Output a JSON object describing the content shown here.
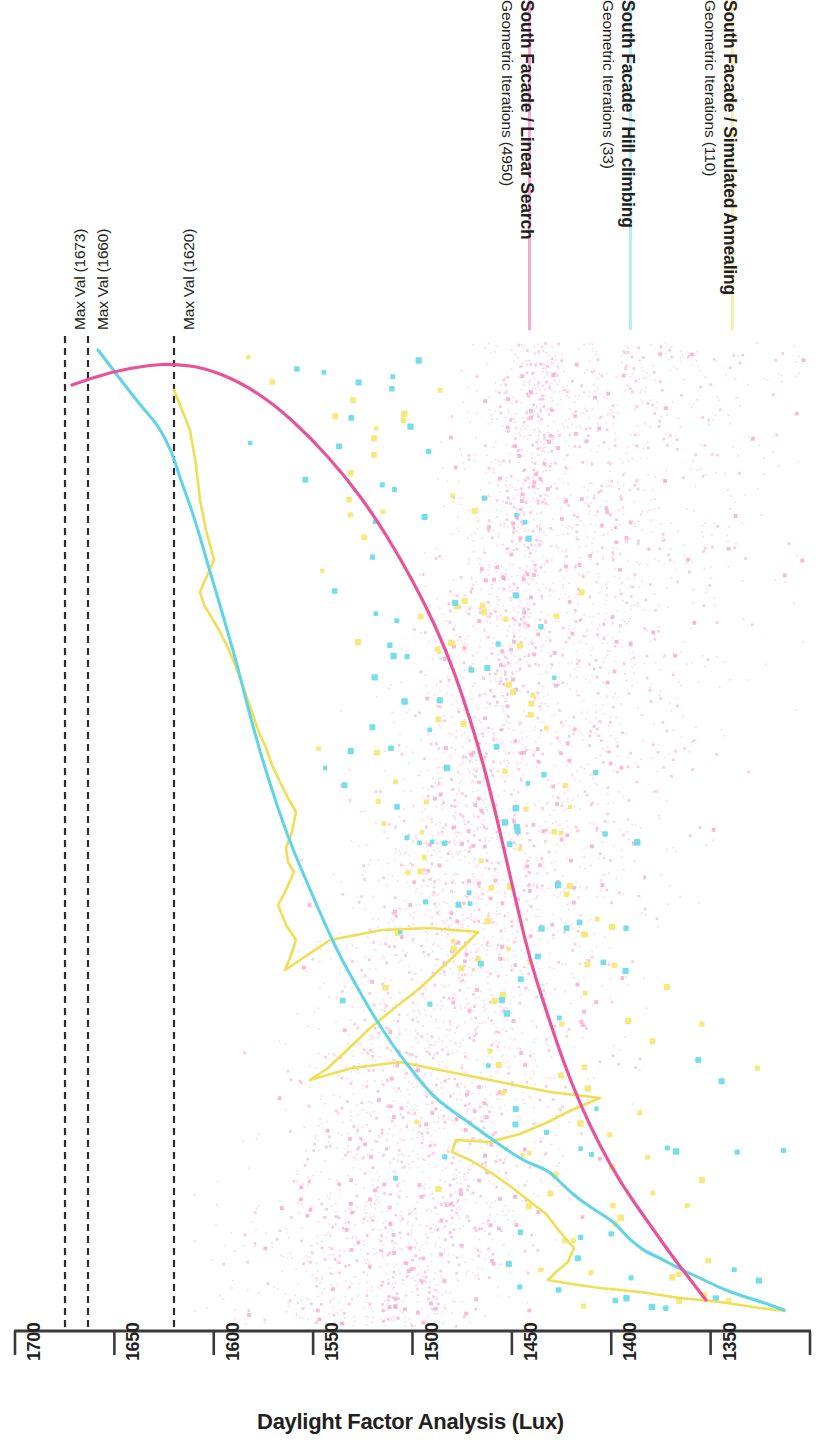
{
  "figure": {
    "axis_title": "Daylight Factor Analysis (Lux)",
    "background": "#ffffff",
    "axis_color": "#3a3a3a",
    "text_color": "#231f20"
  },
  "legend": {
    "position": "top",
    "orientation": "vertical-rotated",
    "entries": [
      {
        "title": "South Facade / Linear Search",
        "subtitle": "Geometric Iterations (4950)",
        "color": "#f7a8ce",
        "series_key": "linear_search",
        "x": 528
      },
      {
        "title": "South Facade / Hill climbing",
        "subtitle": "Geometric Iterations (33)",
        "color": "#b9ecf5",
        "series_key": "hill_climbing",
        "x": 629
      },
      {
        "title": "South Facade / Simulated Annealing",
        "subtitle": "Geometric Iterations (110)",
        "color": "#f7efb0",
        "series_key": "simulated_annealing",
        "x": 731
      }
    ]
  },
  "annotations": [
    {
      "label": "Max Val (1673)",
      "value": 1673,
      "x": 65
    },
    {
      "label": "Max Val (1660)",
      "value": 1660,
      "x": 88
    },
    {
      "label": "Max Val (1620)",
      "value": 1620,
      "x": 174
    }
  ],
  "chart_data": {
    "type": "scatter",
    "title": "",
    "subtitle": "",
    "xlabel": "Daylight Factor Analysis (Lux)",
    "ylabel": "",
    "xlim": [
      1700,
      1300
    ],
    "x_axis_reversed": true,
    "xticks": [
      1700,
      1650,
      1600,
      1550,
      1500,
      1450,
      1400,
      1350,
      1300
    ],
    "xticklabels": [
      "1700",
      "1650",
      "1600",
      "1550",
      "1500",
      "1450",
      "1400",
      "1350",
      "1300"
    ],
    "grid": false,
    "legend_position": "top",
    "series": [
      {
        "name": "South Facade / Linear Search",
        "color": "#e8529b",
        "marker_color": "#f7a8ce",
        "iterations": 4950,
        "max_val": 1673,
        "trend_type": "smooth-curve",
        "trend": [
          [
            72,
            385
          ],
          [
            110,
            372
          ],
          [
            150,
            365
          ],
          [
            175,
            364
          ],
          [
            205,
            368
          ],
          [
            240,
            382
          ],
          [
            275,
            405
          ],
          [
            310,
            437
          ],
          [
            345,
            476
          ],
          [
            375,
            517
          ],
          [
            400,
            558
          ],
          [
            424,
            602
          ],
          [
            446,
            650
          ],
          [
            464,
            700
          ],
          [
            480,
            752
          ],
          [
            494,
            806
          ],
          [
            506,
            858
          ],
          [
            518,
            910
          ],
          [
            530,
            960
          ],
          [
            546,
            1010
          ],
          [
            562,
            1058
          ],
          [
            580,
            1104
          ],
          [
            600,
            1146
          ],
          [
            622,
            1185
          ],
          [
            648,
            1222
          ],
          [
            672,
            1256
          ],
          [
            692,
            1282
          ],
          [
            706,
            1300
          ]
        ]
      },
      {
        "name": "South Facade / Hill climbing",
        "color": "#5fd4e6",
        "marker_color": "#6fdcea",
        "iterations": 33,
        "max_val": 1673,
        "trend_type": "polyline",
        "trend": [
          [
            98,
            350
          ],
          [
            140,
            405
          ],
          [
            158,
            425
          ],
          [
            172,
            452
          ],
          [
            180,
            478
          ],
          [
            190,
            505
          ],
          [
            198,
            530
          ],
          [
            206,
            558
          ],
          [
            214,
            585
          ],
          [
            222,
            612
          ],
          [
            230,
            640
          ],
          [
            238,
            668
          ],
          [
            246,
            700
          ],
          [
            254,
            730
          ],
          [
            262,
            758
          ],
          [
            272,
            790
          ],
          [
            282,
            820
          ],
          [
            294,
            852
          ],
          [
            306,
            880
          ],
          [
            318,
            908
          ],
          [
            330,
            935
          ],
          [
            342,
            960
          ],
          [
            356,
            985
          ],
          [
            370,
            1010
          ],
          [
            386,
            1035
          ],
          [
            402,
            1058
          ],
          [
            418,
            1078
          ],
          [
            432,
            1095
          ],
          [
            448,
            1108
          ],
          [
            468,
            1122
          ],
          [
            490,
            1138
          ],
          [
            510,
            1152
          ],
          [
            528,
            1163
          ],
          [
            548,
            1170
          ],
          [
            566,
            1188
          ],
          [
            580,
            1200
          ],
          [
            598,
            1212
          ],
          [
            614,
            1222
          ],
          [
            630,
            1240
          ],
          [
            646,
            1252
          ],
          [
            660,
            1258
          ],
          [
            678,
            1268
          ],
          [
            700,
            1278
          ],
          [
            720,
            1288
          ],
          [
            742,
            1296
          ],
          [
            762,
            1302
          ],
          [
            784,
            1310
          ]
        ]
      },
      {
        "name": "South Facade / Simulated Annealing",
        "color": "#f0de55",
        "marker_color": "#f7e877",
        "iterations": 110,
        "max_val": 1620,
        "trend_type": "polyline-jagged",
        "trend": [
          [
            174,
            390
          ],
          [
            190,
            430
          ],
          [
            196,
            465
          ],
          [
            200,
            500
          ],
          [
            206,
            530
          ],
          [
            214,
            560
          ],
          [
            206,
            578
          ],
          [
            200,
            592
          ],
          [
            204,
            605
          ],
          [
            212,
            618
          ],
          [
            220,
            632
          ],
          [
            228,
            648
          ],
          [
            234,
            662
          ],
          [
            240,
            678
          ],
          [
            246,
            695
          ],
          [
            252,
            712
          ],
          [
            258,
            730
          ],
          [
            266,
            748
          ],
          [
            272,
            765
          ],
          [
            280,
            782
          ],
          [
            288,
            798
          ],
          [
            296,
            812
          ],
          [
            292,
            832
          ],
          [
            286,
            848
          ],
          [
            288,
            862
          ],
          [
            294,
            872
          ],
          [
            286,
            890
          ],
          [
            278,
            905
          ],
          [
            286,
            925
          ],
          [
            296,
            940
          ],
          [
            290,
            958
          ],
          [
            285,
            970
          ],
          [
            330,
            940
          ],
          [
            382,
            930
          ],
          [
            430,
            928
          ],
          [
            478,
            932
          ],
          [
            452,
            958
          ],
          [
            420,
            988
          ],
          [
            392,
            1010
          ],
          [
            368,
            1030
          ],
          [
            345,
            1052
          ],
          [
            328,
            1068
          ],
          [
            310,
            1080
          ],
          [
            352,
            1068
          ],
          [
            400,
            1062
          ],
          [
            450,
            1072
          ],
          [
            500,
            1082
          ],
          [
            550,
            1092
          ],
          [
            600,
            1098
          ],
          [
            572,
            1110
          ],
          [
            548,
            1122
          ],
          [
            520,
            1134
          ],
          [
            490,
            1142
          ],
          [
            456,
            1140
          ],
          [
            452,
            1152
          ],
          [
            470,
            1160
          ],
          [
            490,
            1172
          ],
          [
            510,
            1186
          ],
          [
            528,
            1200
          ],
          [
            546,
            1214
          ],
          [
            560,
            1232
          ],
          [
            574,
            1248
          ],
          [
            568,
            1262
          ],
          [
            556,
            1272
          ],
          [
            548,
            1280
          ],
          [
            572,
            1284
          ],
          [
            600,
            1288
          ],
          [
            640,
            1292
          ],
          [
            680,
            1298
          ],
          [
            720,
            1302
          ],
          [
            760,
            1308
          ],
          [
            785,
            1311
          ]
        ]
      }
    ],
    "scatter_summary": {
      "linear_search_points": 4950,
      "linear_search_cloud": "dense fine pink dots, x 1660 to 1300, concentrated right of trend curve",
      "hill_climbing_points": 33,
      "simulated_annealing_points": 110
    }
  }
}
